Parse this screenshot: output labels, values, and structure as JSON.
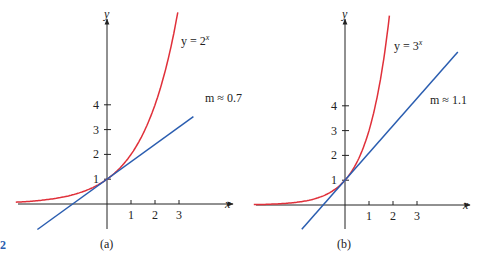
{
  "colors": {
    "curve": "#e0303a",
    "tangent": "#2a5db0",
    "axis": "#222222"
  },
  "chart_data": [
    {
      "type": "line",
      "caption": "(a)",
      "xlabel": "x",
      "ylabel": "y",
      "x_ticks": [
        "1",
        "2",
        "3"
      ],
      "y_ticks": [
        "1",
        "2",
        "3",
        "4"
      ],
      "xlim": [
        -4.1,
        4.2
      ],
      "ylim": [
        -0.8,
        7.9
      ],
      "series": [
        {
          "name": "y = 2^x",
          "label": "y = 2",
          "label_sup": "x",
          "function": "2^x",
          "x_range": [
            -3.8,
            2.95
          ]
        },
        {
          "name": "tangent line",
          "label": "m ≈ 0.7",
          "slope": 0.7,
          "point": [
            0,
            1
          ],
          "x_range": [
            -2.9,
            3.6
          ]
        }
      ]
    },
    {
      "type": "line",
      "caption": "(b)",
      "xlabel": "x",
      "ylabel": "y",
      "x_ticks": [
        "1",
        "2",
        "3"
      ],
      "y_ticks": [
        "1",
        "2",
        "3",
        "4"
      ],
      "xlim": [
        -3.8,
        4.2
      ],
      "ylim": [
        -0.8,
        7.9
      ],
      "series": [
        {
          "name": "y = 3^x",
          "label": "y = 3",
          "label_sup": "x",
          "function": "3^x",
          "x_range": [
            -3.8,
            1.85
          ]
        },
        {
          "name": "tangent line",
          "label": "m ≈ 1.1",
          "slope": 1.1,
          "point": [
            0,
            1
          ],
          "x_range": [
            -1.8,
            4.7
          ]
        }
      ]
    }
  ],
  "figure_marker": "2"
}
